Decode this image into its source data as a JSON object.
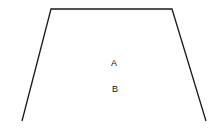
{
  "diagram": {
    "shape": "trapezoid-open-bottom",
    "labels": [
      {
        "id": "A",
        "text": "A"
      },
      {
        "id": "B",
        "text": "B"
      }
    ],
    "stroke_color": "#1a1a1a"
  }
}
